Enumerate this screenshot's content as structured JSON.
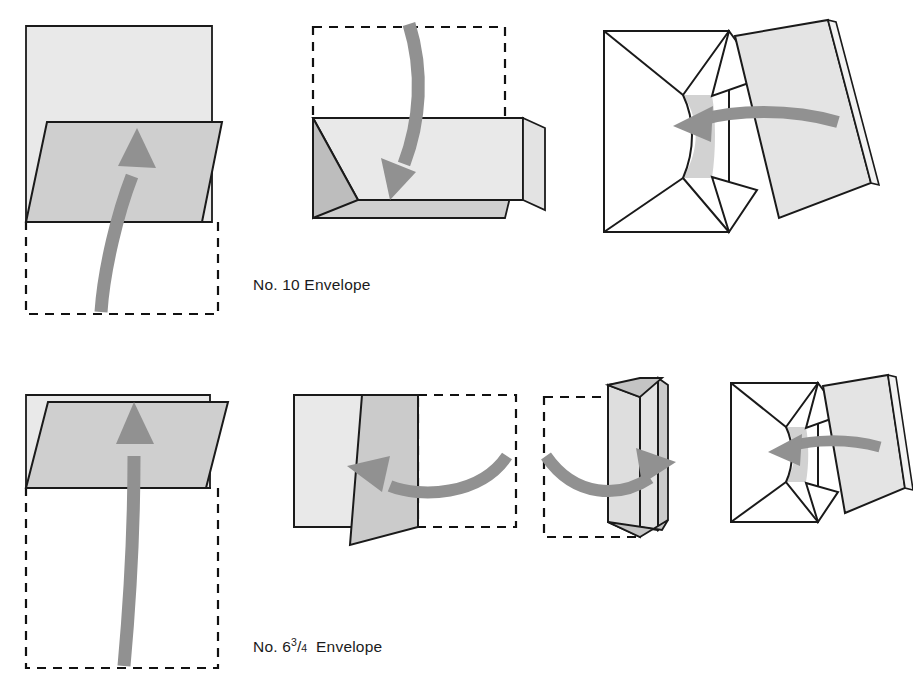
{
  "figure": {
    "title_row_1": "No. 10 Envelope",
    "title_row_2_prefix": "No. 6",
    "title_row_2_numerator": "3",
    "title_row_2_bar": "/",
    "title_row_2_denominator": "4",
    "title_row_2_suffix": "Envelope"
  },
  "colors": {
    "paper_light": "#e9e9e9",
    "paper_mid": "#cfcfcf",
    "paper_dark": "#bdbdbd",
    "paper_white": "#ffffff",
    "outline": "#1a1a1a",
    "arrow": "#919191",
    "dashed": "#111111",
    "background": "#ffffff"
  },
  "rows": [
    {
      "name": "no-10-envelope",
      "label": "No. 10 Envelope",
      "steps": [
        {
          "index": 1,
          "name": "fold-bottom-third-up",
          "arrow_direction": "up",
          "has_dashed_guide": true
        },
        {
          "index": 2,
          "name": "fold-top-third-down",
          "arrow_direction": "down",
          "has_dashed_guide": true
        },
        {
          "index": 3,
          "name": "insert-letter-into-envelope",
          "arrow_direction": "left",
          "has_dashed_guide": false
        }
      ]
    },
    {
      "name": "no-6-3-4-envelope",
      "label": "No. 6 3/4 Envelope",
      "steps": [
        {
          "index": 1,
          "name": "fold-bottom-half-up",
          "arrow_direction": "up",
          "has_dashed_guide": true
        },
        {
          "index": 2,
          "name": "fold-right-third-left",
          "arrow_direction": "left",
          "has_dashed_guide": true
        },
        {
          "index": 3,
          "name": "fold-left-third-right",
          "arrow_direction": "right",
          "has_dashed_guide": true
        },
        {
          "index": 4,
          "name": "insert-letter-into-envelope",
          "arrow_direction": "left",
          "has_dashed_guide": false
        }
      ]
    }
  ]
}
